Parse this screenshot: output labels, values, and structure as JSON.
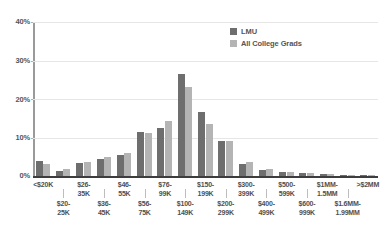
{
  "chart_data": {
    "type": "bar",
    "title": "",
    "xlabel": "",
    "ylabel": "",
    "ylim": [
      0,
      40
    ],
    "grid": true,
    "legend_position": "top-right",
    "ytick_labels": [
      "40%",
      "30%",
      "20%",
      "10%",
      "0%"
    ],
    "ytick_values": [
      40,
      30,
      20,
      10,
      0
    ],
    "categories": [
      "<$20K",
      "$20-\n25K",
      "$26-\n35K",
      "$36-\n45K",
      "$46-\n55K",
      "$56-\n75K",
      "$76-\n99K",
      "$100-\n149K",
      "$150-\n199K",
      "$200-\n299K",
      "$300-\n399K",
      "$400-\n499K",
      "$500-\n599K",
      "$600-\n999K",
      "$1MM-\n1.5MM",
      "$1.6MM-\n1.99MM",
      ">$2MM"
    ],
    "series": [
      {
        "name": "LMU",
        "color": "#6e6e6e",
        "values": [
          3.9,
          1.4,
          3.4,
          4.5,
          5.5,
          11.5,
          12.5,
          26.5,
          16.5,
          9.0,
          3.2,
          1.6,
          1.0,
          0.9,
          0.6,
          0.2,
          0.3
        ]
      },
      {
        "name": "All College Grads",
        "color": "#b4b4b4",
        "values": [
          3.0,
          1.8,
          3.6,
          4.9,
          6.0,
          11.2,
          14.2,
          23.0,
          13.5,
          9.0,
          3.6,
          1.8,
          1.0,
          0.9,
          0.5,
          0.2,
          0.3
        ]
      }
    ]
  },
  "legend": {
    "items": [
      {
        "label": "LMU"
      },
      {
        "label": "All College Grads"
      }
    ]
  }
}
